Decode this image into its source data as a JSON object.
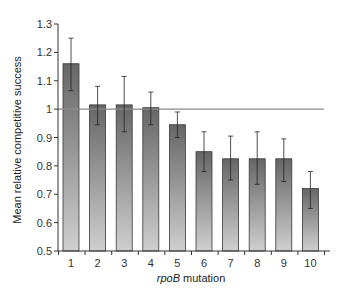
{
  "chart_data": {
    "type": "bar",
    "title": "",
    "xlabel_italic": "rpoB",
    "xlabel_rest": " mutation",
    "xlabel": "rpoB mutation",
    "ylabel": "Mean relative competitive success",
    "ylim": [
      0.5,
      1.3
    ],
    "yticks": [
      0.5,
      0.6,
      0.7,
      0.8,
      0.9,
      1,
      1.1,
      1.2,
      1.3
    ],
    "ytick_labels": [
      "0.5",
      "0.6",
      "0.7",
      "0.8",
      "0.9",
      "1",
      "1.1",
      "1.2",
      "1.3"
    ],
    "categories": [
      "1",
      "2",
      "3",
      "4",
      "5",
      "6",
      "7",
      "8",
      "9",
      "10"
    ],
    "values": [
      1.16,
      1.015,
      1.015,
      1.005,
      0.945,
      0.85,
      0.825,
      0.825,
      0.825,
      0.72
    ],
    "error_upper": [
      1.25,
      1.08,
      1.115,
      1.06,
      0.99,
      0.92,
      0.905,
      0.92,
      0.895,
      0.78
    ],
    "error_lower": [
      1.065,
      0.945,
      0.92,
      0.945,
      0.9,
      0.78,
      0.75,
      0.735,
      0.745,
      0.65
    ],
    "reference_line": 1.0,
    "grid": false,
    "legend": null,
    "colors": {
      "bar_top": "#666666",
      "bar_bottom": "#cfcfcf",
      "bar_stroke": "#3a3a3a",
      "reference_line": "#8a8a8a",
      "axis": "#333333",
      "error_bar": "#222222"
    }
  }
}
